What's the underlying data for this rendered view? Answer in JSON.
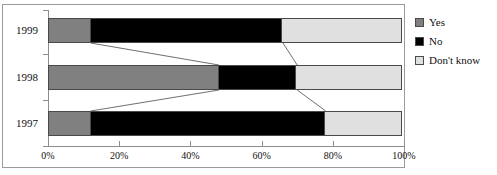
{
  "chart_data": {
    "type": "bar",
    "subtype": "stacked-horizontal-100pct",
    "title": "",
    "xlabel": "",
    "ylabel": "",
    "categories": [
      "1999",
      "1998",
      "1997"
    ],
    "category_order_top_to_bottom": [
      "1999",
      "1998",
      "1997"
    ],
    "series": [
      {
        "name": "Yes",
        "color": "#808080",
        "values": [
          12,
          48,
          12
        ]
      },
      {
        "name": "No",
        "color": "#000000",
        "values": [
          54,
          22,
          66
        ]
      },
      {
        "name": "Don't know",
        "color": "#e0e0e0",
        "values": [
          34,
          30,
          22
        ]
      }
    ],
    "cumulative_boundaries": {
      "1999": [
        12,
        66,
        100
      ],
      "1998": [
        48,
        70,
        100
      ],
      "1997": [
        12,
        78,
        100
      ]
    },
    "xlim": [
      0,
      100
    ],
    "xticks": [
      0,
      20,
      40,
      60,
      80,
      100
    ],
    "xtick_labels": [
      "0%",
      "20%",
      "40%",
      "60%",
      "80%",
      "100%"
    ],
    "grid": false,
    "legend_position": "right",
    "connectors": true
  },
  "axis": {
    "x_tick_labels": [
      "0%",
      "20%",
      "40%",
      "60%",
      "80%",
      "100%"
    ],
    "y_tick_labels": [
      "1999",
      "1998",
      "1997"
    ]
  },
  "legend": {
    "items": [
      {
        "label": "Yes",
        "color": "#808080"
      },
      {
        "label": "No",
        "color": "#000000"
      },
      {
        "label": "Don't know",
        "color": "#e0e0e0"
      }
    ]
  },
  "colors": {
    "yes": "#808080",
    "no": "#000000",
    "dont_know": "#e0e0e0",
    "axis": "#8d8d8d",
    "frame": "#9a9a9a",
    "segment_border": "#4a4a4a",
    "background": "#ffffff"
  }
}
